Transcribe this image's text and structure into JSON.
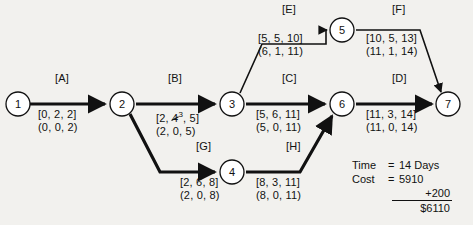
{
  "diagram": {
    "type": "project-network-cpm",
    "nodes": [
      {
        "id": "1",
        "label": "1",
        "cx": 18,
        "cy": 104
      },
      {
        "id": "2",
        "label": "2",
        "cx": 122,
        "cy": 104
      },
      {
        "id": "3",
        "label": "3",
        "cx": 232,
        "cy": 104
      },
      {
        "id": "4",
        "label": "4",
        "cx": 232,
        "cy": 172
      },
      {
        "id": "5",
        "label": "5",
        "cx": 342,
        "cy": 30
      },
      {
        "id": "6",
        "label": "6",
        "cx": 342,
        "cy": 104
      },
      {
        "id": "7",
        "label": "7",
        "cx": 448,
        "cy": 104
      }
    ],
    "activities": [
      {
        "id": "A",
        "label": "[A]",
        "from": "1",
        "to": "2",
        "bracket": "[0, 2, 2]",
        "paren": "(0, 0, 2)",
        "label_x": 55,
        "label_y": 78,
        "times_x": 38,
        "times_y": 112
      },
      {
        "id": "B",
        "label": "[B]",
        "from": "2",
        "to": "3",
        "bracket_prefix": "[2, ",
        "bracket_struck": "4",
        "bracket_sup": "3",
        "bracket_suffix": ", 5]",
        "bracket": "[2, 4³, 5]",
        "paren": "(2, 0, 5)",
        "label_x": 168,
        "label_y": 78,
        "times_x": 156,
        "times_y": 112,
        "revised": true
      },
      {
        "id": "C",
        "label": "[C]",
        "from": "3",
        "to": "6",
        "bracket": "[5, 6, 11]",
        "paren": "(5, 0, 11)",
        "label_x": 282,
        "label_y": 78,
        "times_x": 256,
        "times_y": 112
      },
      {
        "id": "D",
        "label": "[D]",
        "from": "6",
        "to": "7",
        "bracket": "[11, 3, 14]",
        "paren": "(11, 0, 14)",
        "label_x": 392,
        "label_y": 78,
        "times_x": 366,
        "times_y": 112
      },
      {
        "id": "E",
        "label": "[E]",
        "from": "3",
        "to": "5",
        "bracket": "[5, 5, 10]",
        "paren": "(6, 1, 11)",
        "label_x": 282,
        "label_y": 7,
        "times_x": 258,
        "times_y": 36
      },
      {
        "id": "F",
        "label": "[F]",
        "from": "5",
        "to": "7",
        "bracket": "[10, 5, 13]",
        "paren": "(11, 1, 14)",
        "label_x": 392,
        "label_y": 7,
        "times_x": 366,
        "times_y": 36
      },
      {
        "id": "G",
        "label": "[G]",
        "from": "2",
        "to": "4",
        "bracket": "[2, 6, 8]",
        "paren": "(2, 0, 8)",
        "label_x": 196,
        "label_y": 146,
        "times_x": 180,
        "times_y": 180
      },
      {
        "id": "H",
        "label": "[H]",
        "from": "4",
        "to": "6",
        "bracket": "[8, 3, 11]",
        "paren": "(8, 0, 11)",
        "label_x": 286,
        "label_y": 146,
        "times_x": 256,
        "times_y": 180
      }
    ]
  },
  "summary": {
    "time_label": "Time",
    "time_eq": "=",
    "time_value": "14 Days",
    "cost_label": "Cost",
    "cost_eq": "=",
    "cost_value": "5910",
    "addition": "+200",
    "total": "$6110"
  },
  "colors": {
    "background": "#f2f1ee",
    "ink": "#111111",
    "node_fill": "#ffffff"
  }
}
